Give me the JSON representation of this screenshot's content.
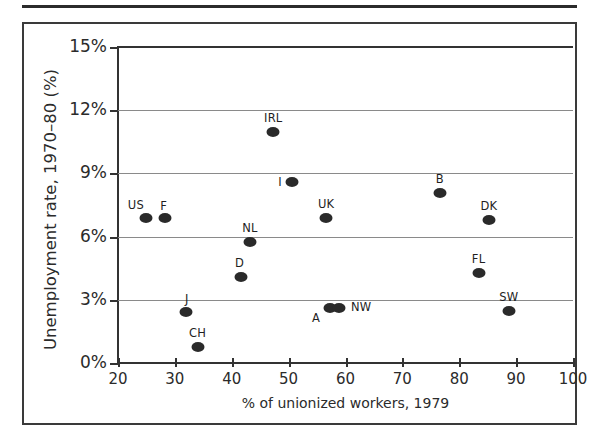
{
  "chart_data": {
    "type": "scatter",
    "title": "",
    "xlabel": "% of unionized workers, 1979",
    "ylabel": "Unemployment rate, 1970–80 (%)",
    "xlim": [
      20,
      100
    ],
    "ylim": [
      0,
      15
    ],
    "xticks": [
      "20",
      "30",
      "40",
      "50",
      "60",
      "70",
      "80",
      "90",
      "100"
    ],
    "xtick_values": [
      20,
      30,
      40,
      50,
      60,
      70,
      80,
      90,
      100
    ],
    "yticks": [
      "0%",
      "3%",
      "6%",
      "9%",
      "12%",
      "15%"
    ],
    "ytick_values": [
      0,
      3,
      6,
      9,
      12,
      15
    ],
    "grid": "horizontal",
    "gridline_values": [
      3,
      6,
      9,
      12
    ],
    "legend": "none",
    "marker_color": "#2a2a2a",
    "points": [
      {
        "label": "US",
        "x": 24.9,
        "y": 6.9,
        "label_dx": -10,
        "label_dy": -13
      },
      {
        "label": "F",
        "x": 28.2,
        "y": 6.9,
        "label_dx": -1,
        "label_dy": -12
      },
      {
        "label": "J",
        "x": 31.9,
        "y": 2.4,
        "label_dx": 1,
        "label_dy": -13
      },
      {
        "label": "CH",
        "x": 34.0,
        "y": 0.75,
        "label_dx": 0,
        "label_dy": -14
      },
      {
        "label": "D",
        "x": 41.7,
        "y": 4.1,
        "label_dx": -2,
        "label_dy": -14
      },
      {
        "label": "NL",
        "x": 43.2,
        "y": 5.75,
        "label_dx": 0,
        "label_dy": -14
      },
      {
        "label": "IRL",
        "x": 47.3,
        "y": 10.95,
        "label_dx": 0,
        "label_dy": -14
      },
      {
        "label": "I",
        "x": 50.6,
        "y": 8.6,
        "label_dx": -12,
        "label_dy": 0
      },
      {
        "label": "UK",
        "x": 56.6,
        "y": 6.9,
        "label_dx": 0,
        "label_dy": -14
      },
      {
        "label": "A",
        "x": 57.3,
        "y": 2.6,
        "label_dx": -14,
        "label_dy": 10
      },
      {
        "label": "NW",
        "x": 58.9,
        "y": 2.6,
        "label_dx": 22,
        "label_dy": -1
      },
      {
        "label": "B",
        "x": 76.6,
        "y": 8.05,
        "label_dx": 0,
        "label_dy": -14
      },
      {
        "label": "FL",
        "x": 83.4,
        "y": 4.25,
        "label_dx": 0,
        "label_dy": -14
      },
      {
        "label": "DK",
        "x": 85.2,
        "y": 6.8,
        "label_dx": 0,
        "label_dy": -14
      },
      {
        "label": "SW",
        "x": 88.7,
        "y": 2.45,
        "label_dx": 0,
        "label_dy": -14
      }
    ]
  }
}
